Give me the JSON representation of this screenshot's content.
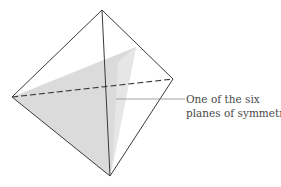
{
  "diagram": {
    "vertices": {
      "top": [
        102,
        10
      ],
      "left": [
        12,
        97
      ],
      "right": [
        173,
        79
      ],
      "bottom": [
        110,
        176
      ]
    },
    "plane_apex": [
      136,
      47
    ],
    "colors": {
      "edge": "#3a3a3a",
      "plane_fill": "#d9d9d9",
      "leader": "#8a8a8a",
      "label_text": "#4a4a4a"
    }
  },
  "annotation": {
    "line1": "One of the six",
    "line2": "planes of symmetry"
  }
}
